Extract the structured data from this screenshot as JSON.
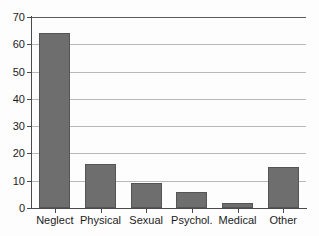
{
  "chart_data": {
    "type": "bar",
    "title": "",
    "subtitle": "",
    "xlabel": "",
    "ylabel": "",
    "categories": [
      "Neglect",
      "Physical",
      "Sexual",
      "Psychol.",
      "Medical",
      "Other"
    ],
    "values": [
      64,
      16,
      9,
      6,
      2,
      15
    ],
    "ylim": [
      0,
      70
    ],
    "yticks": [
      0,
      10,
      20,
      30,
      40,
      50,
      60,
      70
    ],
    "ytick_labels": [
      "0",
      "10",
      "20",
      "30",
      "40",
      "50",
      "60",
      "70"
    ],
    "grid": true,
    "grid_axis": "y",
    "legend": false,
    "legend_position": "none",
    "bar_color": "#6e6e6e",
    "bar_edge_color": "#555555",
    "axis_color": "#4b4b4b",
    "grid_color": "#b9b9b9",
    "background_color": "#fdfdfd",
    "annotations": []
  }
}
